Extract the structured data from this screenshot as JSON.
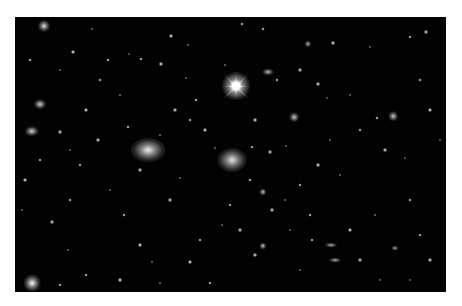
{
  "image": {
    "description": "Deep-field astronomical photograph of a galaxy cluster on black background with white border",
    "background_color": "#020202",
    "border_color": "#ffffff",
    "frame": {
      "x": 15,
      "y": 17,
      "w": 431,
      "h": 275
    }
  },
  "bright_star": {
    "x": 236,
    "y": 86,
    "r": 7,
    "spike_len": 34
  },
  "galaxies": [
    {
      "x": 148,
      "y": 150,
      "rx": 14,
      "ry": 10,
      "b": 0.95
    },
    {
      "x": 232,
      "y": 160,
      "rx": 12,
      "ry": 10,
      "b": 0.9
    },
    {
      "x": 32,
      "y": 283,
      "rx": 7,
      "ry": 7,
      "b": 1.0
    },
    {
      "x": 44,
      "y": 26,
      "rx": 5,
      "ry": 5,
      "b": 0.9
    },
    {
      "x": 32,
      "y": 131,
      "rx": 6,
      "ry": 4,
      "b": 0.85
    },
    {
      "x": 40,
      "y": 104,
      "rx": 5,
      "ry": 4,
      "b": 0.85
    },
    {
      "x": 294,
      "y": 117,
      "rx": 4,
      "ry": 4,
      "b": 0.8
    },
    {
      "x": 393,
      "y": 116,
      "rx": 4,
      "ry": 4,
      "b": 0.8
    },
    {
      "x": 263,
      "y": 246,
      "rx": 3,
      "ry": 3,
      "b": 0.8
    },
    {
      "x": 263,
      "y": 192,
      "rx": 3,
      "ry": 3,
      "b": 0.8
    },
    {
      "x": 268,
      "y": 72,
      "rx": 5,
      "ry": 3,
      "b": 0.75
    },
    {
      "x": 335,
      "y": 260,
      "rx": 5,
      "ry": 2,
      "b": 0.7
    },
    {
      "x": 331,
      "y": 245,
      "rx": 5,
      "ry": 2,
      "b": 0.7
    },
    {
      "x": 308,
      "y": 44,
      "rx": 3,
      "ry": 3,
      "b": 0.7
    },
    {
      "x": 395,
      "y": 248,
      "rx": 3,
      "ry": 2,
      "b": 0.7
    }
  ],
  "stars": [
    [
      92,
      29
    ],
    [
      263,
      29
    ],
    [
      171,
      36
    ],
    [
      129,
      54
    ],
    [
      141,
      59
    ],
    [
      333,
      43
    ],
    [
      370,
      47
    ],
    [
      410,
      37
    ],
    [
      426,
      32
    ],
    [
      188,
      45
    ],
    [
      108,
      60
    ],
    [
      161,
      64
    ],
    [
      186,
      78
    ],
    [
      242,
      24
    ],
    [
      73,
      52
    ],
    [
      225,
      65
    ],
    [
      277,
      80
    ],
    [
      318,
      84
    ],
    [
      350,
      95
    ],
    [
      420,
      80
    ],
    [
      300,
      70
    ],
    [
      327,
      98
    ],
    [
      377,
      118
    ],
    [
      385,
      150
    ],
    [
      405,
      158
    ],
    [
      410,
      200
    ],
    [
      60,
      132
    ],
    [
      70,
      150
    ],
    [
      80,
      165
    ],
    [
      98,
      140
    ],
    [
      110,
      190
    ],
    [
      124,
      215
    ],
    [
      140,
      245
    ],
    [
      152,
      262
    ],
    [
      200,
      240
    ],
    [
      170,
      200
    ],
    [
      180,
      178
    ],
    [
      70,
      200
    ],
    [
      52,
      222
    ],
    [
      68,
      250
    ],
    [
      86,
      275
    ],
    [
      120,
      280
    ],
    [
      160,
      283
    ],
    [
      210,
      283
    ],
    [
      255,
      255
    ],
    [
      300,
      270
    ],
    [
      312,
      240
    ],
    [
      350,
      230
    ],
    [
      375,
      215
    ],
    [
      420,
      235
    ],
    [
      430,
      260
    ],
    [
      380,
      280
    ],
    [
      250,
      180
    ],
    [
      272,
      210
    ],
    [
      285,
      200
    ],
    [
      300,
      185
    ],
    [
      318,
      165
    ],
    [
      340,
      175
    ],
    [
      190,
      120
    ],
    [
      205,
      130
    ],
    [
      215,
      148
    ],
    [
      252,
      147
    ],
    [
      270,
      152
    ],
    [
      286,
      146
    ],
    [
      196,
      100
    ],
    [
      175,
      110
    ],
    [
      120,
      95
    ],
    [
      100,
      80
    ],
    [
      86,
      110
    ],
    [
      60,
      70
    ],
    [
      30,
      60
    ],
    [
      25,
      180
    ],
    [
      22,
      210
    ],
    [
      40,
      160
    ],
    [
      140,
      170
    ],
    [
      160,
      135
    ],
    [
      128,
      127
    ],
    [
      255,
      120
    ],
    [
      330,
      140
    ],
    [
      360,
      130
    ],
    [
      430,
      110
    ],
    [
      440,
      140
    ],
    [
      230,
      205
    ],
    [
      240,
      230
    ],
    [
      290,
      230
    ],
    [
      310,
      215
    ],
    [
      360,
      260
    ],
    [
      410,
      280
    ],
    [
      60,
      285
    ],
    [
      190,
      262
    ],
    [
      222,
      225
    ]
  ]
}
